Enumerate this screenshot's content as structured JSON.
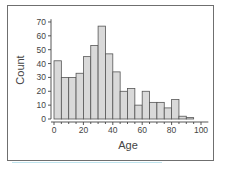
{
  "chart_data": {
    "type": "bar",
    "title": "",
    "xlabel": "Age",
    "ylabel": "Count",
    "bin_width": 5,
    "bin_edges": [
      0,
      5,
      10,
      15,
      20,
      25,
      30,
      35,
      40,
      45,
      50,
      55,
      60,
      65,
      70,
      75,
      80,
      85,
      90,
      95
    ],
    "categories": [
      "0-5",
      "5-10",
      "10-15",
      "15-20",
      "20-25",
      "25-30",
      "30-35",
      "35-40",
      "40-45",
      "45-50",
      "50-55",
      "55-60",
      "60-65",
      "65-70",
      "70-75",
      "75-80",
      "80-85",
      "85-90",
      "90-95"
    ],
    "values": [
      42,
      30,
      30,
      33,
      45,
      53,
      67,
      47,
      34,
      20,
      22,
      10,
      20,
      12,
      12,
      8,
      14,
      2,
      1
    ],
    "xlim": [
      0,
      105
    ],
    "ylim": [
      0,
      72
    ],
    "xticks": [
      0,
      20,
      40,
      60,
      80,
      100
    ],
    "yticks": [
      0,
      10,
      20,
      30,
      40,
      50,
      60,
      70
    ],
    "grid": false,
    "legend": null,
    "bar_color": "#d9d9d9",
    "edge_color": "#555555"
  }
}
